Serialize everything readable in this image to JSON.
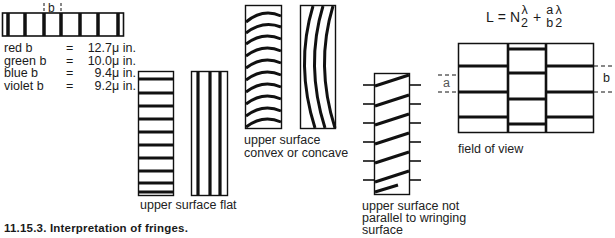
{
  "figure": {
    "caption": "11.15.3.  Interpretation of fringes.",
    "top_strip": {
      "dimension_label": "b"
    },
    "legend": [
      {
        "color": "red b",
        "equals": "=",
        "value": "12.7",
        "unit": "μ in."
      },
      {
        "color": "green b",
        "equals": "=",
        "value": "10.0",
        "unit": "μ in."
      },
      {
        "color": "blue b",
        "equals": "=",
        "value": "9.4",
        "unit": "μ in."
      },
      {
        "color": "violet b",
        "equals": "=",
        "value": "9.2",
        "unit": "μ in."
      }
    ],
    "panels": {
      "flat": {
        "label": "upper surface flat"
      },
      "convex_concave": {
        "label_line1": "upper surface",
        "label_line2": "convex or concave"
      },
      "not_parallel": {
        "label_line1": "upper surface not",
        "label_line2": "parallel to wringing",
        "label_line3": "surface"
      },
      "field_of_view": {
        "label": "field of view",
        "dim_a": "a",
        "dim_b": "b"
      }
    },
    "formula": {
      "lhs": "L",
      "eq": "=",
      "term1_coeff": "N",
      "term1_num": "λ",
      "term1_den": "2",
      "plus": "+",
      "term2_num": "a",
      "term2_den": "b",
      "term3_num": "λ",
      "term3_den": "2"
    }
  }
}
